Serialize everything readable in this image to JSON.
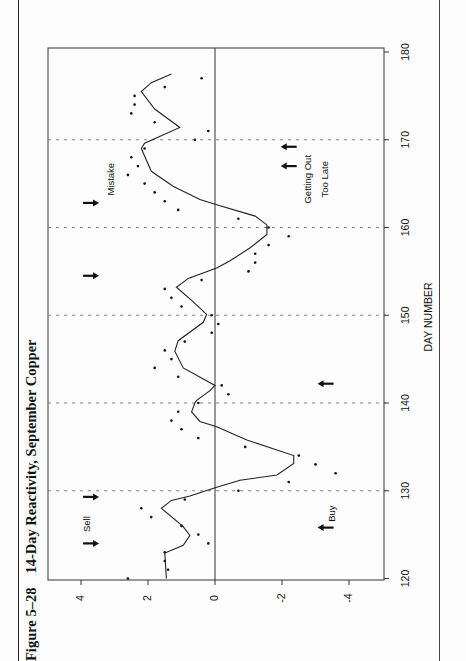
{
  "figure": {
    "number": "Figure 5–28",
    "title": "14-Day Reactivity, September Copper"
  },
  "chart_data": {
    "type": "scatter",
    "title": "14-Day Reactivity, September Copper",
    "xlabel": "DAY NUMBER",
    "ylabel": "",
    "xlim": [
      120,
      180
    ],
    "ylim": [
      -5,
      5
    ],
    "x_ticks": [
      120,
      130,
      140,
      150,
      160,
      170,
      180
    ],
    "x_tick_labels": [
      "120",
      "130",
      "140",
      "150",
      "160",
      "170",
      "180"
    ],
    "y_ticks": [
      4,
      2,
      0,
      -2,
      -4
    ],
    "y_tick_labels": [
      "4",
      "2",
      "0",
      "-2",
      "-4"
    ],
    "grid": "vertical dashed lines at x = 130, 140, 150, 160, 170; solid zero line",
    "orientation": "page rotated 90° counter-clockwise",
    "series": [
      {
        "name": "Daily reactivity",
        "style": "points",
        "x": [
          120,
          121,
          122,
          123,
          124,
          125,
          126,
          127,
          128,
          129,
          130,
          131,
          132,
          133,
          134,
          135,
          136,
          137,
          138,
          139,
          140,
          141,
          142,
          143,
          144,
          145,
          146,
          147,
          148,
          149,
          150,
          151,
          152,
          153,
          154,
          155,
          156,
          157,
          158,
          159,
          160,
          161,
          162,
          163,
          164,
          165,
          166,
          167,
          168,
          169,
          170,
          171,
          172,
          173,
          174,
          175,
          176,
          177
        ],
        "y": [
          2.6,
          1.4,
          1.5,
          1.5,
          0.2,
          0.5,
          1.0,
          1.9,
          2.2,
          0.9,
          -0.7,
          -2.2,
          -3.6,
          -3.0,
          -2.5,
          -0.9,
          0.5,
          1.0,
          1.3,
          1.1,
          0.5,
          -0.4,
          -0.2,
          1.1,
          1.8,
          1.3,
          1.5,
          0.9,
          0.1,
          -0.1,
          0.1,
          1.0,
          1.3,
          1.5,
          0.4,
          -1.0,
          -1.2,
          -1.2,
          -1.6,
          -2.2,
          -1.6,
          -0.7,
          1.1,
          1.5,
          1.8,
          2.1,
          2.6,
          2.3,
          2.5,
          2.1,
          0.6,
          0.2,
          1.8,
          2.5,
          2.4,
          2.4,
          1.5,
          0.4
        ]
      },
      {
        "name": "Smoothed reactivity",
        "style": "line",
        "x": [
          120,
          122.9,
          123.8,
          124.9,
          125.9,
          128,
          128.9,
          129.4,
          130.4,
          131.2,
          131.8,
          133.1,
          134,
          135.8,
          137.3,
          137.9,
          139,
          140,
          140.3,
          141.4,
          142,
          144,
          145.9,
          147.1,
          149.2,
          150.1,
          151.7,
          153.2,
          154.2,
          155.4,
          156.2,
          157.7,
          159.2,
          160.3,
          161.3,
          162.6,
          163.2,
          164.7,
          166.4,
          169,
          169.6,
          171.4,
          173.5,
          175.5,
          176.5,
          177.5
        ],
        "y": [
          1.45,
          1.5,
          0.95,
          0.75,
          0.95,
          1.6,
          1.3,
          0.75,
          -0.05,
          -0.75,
          -1.85,
          -2.35,
          -2.35,
          -0.95,
          -0.05,
          0.45,
          0.7,
          0.6,
          0.55,
          0.15,
          0.0,
          0.95,
          1.2,
          1.1,
          0.35,
          0.25,
          0.7,
          1.15,
          0.8,
          -0.05,
          -0.45,
          -1.05,
          -1.55,
          -1.55,
          -1.2,
          -0.05,
          0.45,
          1.25,
          1.9,
          2.2,
          2.1,
          1.05,
          1.8,
          2.2,
          1.9,
          1.3
        ]
      }
    ],
    "annotations": [
      {
        "text": "Sell",
        "x": 126.2,
        "y": 3.8
      },
      {
        "text": "Buy",
        "x": 127.4,
        "y": -3.5
      },
      {
        "text": "Mistake",
        "x": 165.5,
        "y": 3.1
      },
      {
        "text": "Getting Out",
        "x": 165.5,
        "y": -2.8
      },
      {
        "text": "Too Late",
        "x": 165.5,
        "y": -3.3
      }
    ],
    "arrows": [
      {
        "direction": "down",
        "x": 124,
        "y": 3.7,
        "meaning": "sell signal"
      },
      {
        "direction": "down",
        "x": 129.3,
        "y": 3.7,
        "meaning": "sell signal"
      },
      {
        "direction": "down",
        "x": 154.5,
        "y": 3.7,
        "meaning": "sell signal"
      },
      {
        "direction": "down",
        "x": 162.8,
        "y": 3.7,
        "meaning": "sell signal (mistake)"
      },
      {
        "direction": "up",
        "x": 125.8,
        "y": -3.3,
        "meaning": "buy signal"
      },
      {
        "direction": "up",
        "x": 142.2,
        "y": -3.3,
        "meaning": "buy signal"
      },
      {
        "direction": "up",
        "x": 167,
        "y": -2.2,
        "meaning": "buy signal (getting out too late)"
      },
      {
        "direction": "up",
        "x": 169.2,
        "y": -2.2,
        "meaning": "buy signal (getting out too late)"
      }
    ]
  }
}
